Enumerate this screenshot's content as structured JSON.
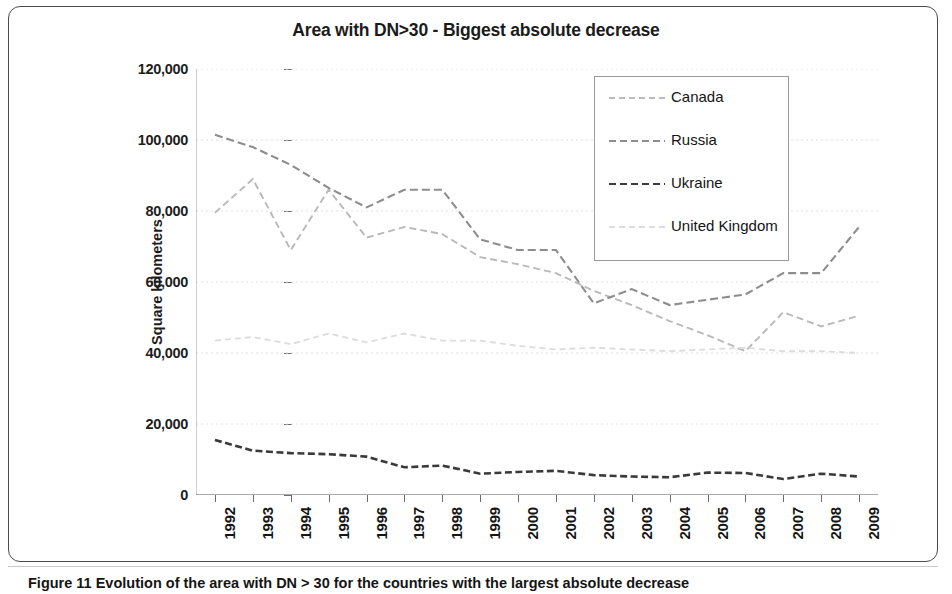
{
  "figure": {
    "caption": "Figure 11  Evolution of the area with DN > 30 for the countries with the largest absolute decrease"
  },
  "chart_data": {
    "type": "line",
    "title": "Area with DN>30 - Biggest absolute decrease",
    "xlabel": "",
    "ylabel": "Square kilometers",
    "grid": true,
    "legend_position": "top-right",
    "ylim": [
      0,
      120000
    ],
    "ytick_labels": [
      "120,000",
      "100,000",
      "80,000",
      "60,000",
      "40,000",
      "20,000",
      "0"
    ],
    "yticks": [
      120000,
      100000,
      80000,
      60000,
      40000,
      20000,
      0
    ],
    "categories": [
      "1992",
      "1993",
      "1994",
      "1995",
      "1996",
      "1997",
      "1998",
      "1999",
      "2000",
      "2001",
      "2002",
      "2003",
      "2004",
      "2005",
      "2006",
      "2007",
      "2008",
      "2009"
    ],
    "x": [
      1992,
      1993,
      1994,
      1995,
      1996,
      1997,
      1998,
      1999,
      2000,
      2001,
      2002,
      2003,
      2004,
      2005,
      2006,
      2007,
      2008,
      2009
    ],
    "series": [
      {
        "name": "Canada",
        "style": "dashed",
        "color": "#b9b9b9",
        "values": [
          79500,
          89000,
          69000,
          86000,
          72500,
          75500,
          73500,
          67000,
          65000,
          62500,
          57500,
          53500,
          49000,
          45000,
          40500,
          51500,
          47500,
          50500
        ]
      },
      {
        "name": "Russia",
        "style": "dashed",
        "color": "#8d8d8d",
        "values": [
          101500,
          98000,
          93000,
          86500,
          81000,
          86000,
          86000,
          72000,
          69000,
          69000,
          54000,
          58000,
          53500,
          55000,
          56500,
          62500,
          62500,
          75500
        ]
      },
      {
        "name": "Ukraine",
        "style": "dashed",
        "color": "#3a3a3a",
        "values": [
          15500,
          12500,
          11800,
          11500,
          10800,
          7800,
          8300,
          6000,
          6500,
          6800,
          5600,
          5200,
          5000,
          6300,
          6200,
          4500,
          6000,
          5200
        ]
      },
      {
        "name": "United Kingdom",
        "style": "dashed",
        "color": "#dddddd",
        "values": [
          43500,
          44500,
          42500,
          45500,
          43000,
          45500,
          43500,
          43500,
          42000,
          41000,
          41500,
          41000,
          40500,
          41000,
          41500,
          40500,
          40500,
          40000
        ]
      }
    ]
  },
  "legend": {
    "items": [
      {
        "label": "Canada"
      },
      {
        "label": "Russia"
      },
      {
        "label": "Ukraine"
      },
      {
        "label": "United Kingdom"
      }
    ]
  }
}
